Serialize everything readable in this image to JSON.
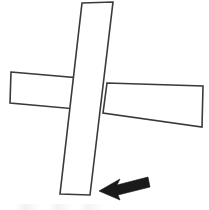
{
  "figure": {
    "kind": "line-drawing",
    "background_color": "#ffffff",
    "stroke_color": "#3a3a3c",
    "arrow_color": "#1a1a1a",
    "width": 209,
    "height": 210,
    "shapes": [
      {
        "name": "vertical-bar",
        "label": "vertical rectangle",
        "points": "82,3 113,2 90,195 60,194",
        "z": 2
      },
      {
        "name": "horizontal-bar-left",
        "label": "horizontal rectangle left segment",
        "points": "11,72 80,78 76,109 10,103",
        "z": 1
      },
      {
        "name": "horizontal-bar-right",
        "label": "horizontal rectangle right segment",
        "points": "107,83 203,86 202,127 103,113",
        "z": 1
      }
    ],
    "arrow": {
      "name": "direction-arrow",
      "label": "arrow pointing left",
      "points": "99,191 120,179 117,185 148,177 150,187 118,195 120,200",
      "tip": "99,191",
      "tail": "149,182",
      "direction": "left"
    },
    "caption": {
      "visible_text": "",
      "note": "faint cut-off marks along bottom edge, illegible"
    }
  }
}
